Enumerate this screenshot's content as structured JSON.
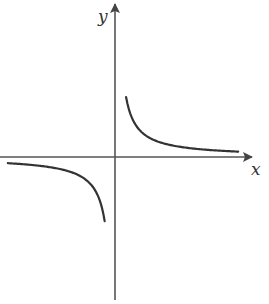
{
  "chart_data": {
    "type": "line",
    "title": "",
    "function": "y = k/x",
    "xlabel": "x",
    "ylabel": "y",
    "grid": false,
    "legend": null,
    "tick_labels": [],
    "series": [
      {
        "name": "branch-quadrant-I",
        "x": [
          0.12,
          0.15,
          0.2,
          0.3,
          0.4,
          0.5,
          0.7,
          1.0,
          1.5,
          2.0,
          2.6
        ],
        "y": [
          2.6,
          2.0,
          1.5,
          1.0,
          0.75,
          0.6,
          0.43,
          0.3,
          0.2,
          0.15,
          0.115
        ]
      },
      {
        "name": "branch-quadrant-III",
        "x": [
          -2.6,
          -2.0,
          -1.5,
          -1.0,
          -0.7,
          -0.5,
          -0.4,
          -0.3,
          -0.2,
          -0.15,
          -0.12
        ],
        "y": [
          -0.115,
          -0.15,
          -0.2,
          -0.3,
          -0.43,
          -0.6,
          -0.75,
          -1.0,
          -1.5,
          -2.0,
          -2.6
        ]
      }
    ],
    "colors": {
      "axes": "#555555",
      "curve": "#333333",
      "label": "#333333"
    }
  },
  "labels": {
    "x_axis": "x",
    "y_axis": "y"
  }
}
